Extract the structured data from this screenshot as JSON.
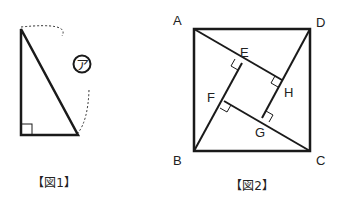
{
  "figure1": {
    "caption": "【図1】",
    "angle_marker": "ア",
    "shape": "right-triangle",
    "vertices": {
      "top": [
        21,
        29
      ],
      "right_angle": [
        21,
        135
      ],
      "bottom_right": [
        78,
        135
      ]
    }
  },
  "figure2": {
    "caption": "【図2】",
    "labels": {
      "A": "A",
      "B": "B",
      "C": "C",
      "D": "D",
      "E": "E",
      "F": "F",
      "G": "G",
      "H": "H"
    },
    "square": {
      "A": [
        194,
        29
      ],
      "D": [
        310,
        29
      ],
      "B": [
        194,
        151
      ],
      "C": [
        310,
        151
      ]
    },
    "inner": {
      "E": [
        242,
        63
      ],
      "H": [
        282,
        80
      ],
      "F": [
        224,
        101
      ],
      "G": [
        262,
        118
      ]
    }
  },
  "colors": {
    "stroke": "#1a1a1a",
    "background": "#ffffff"
  }
}
